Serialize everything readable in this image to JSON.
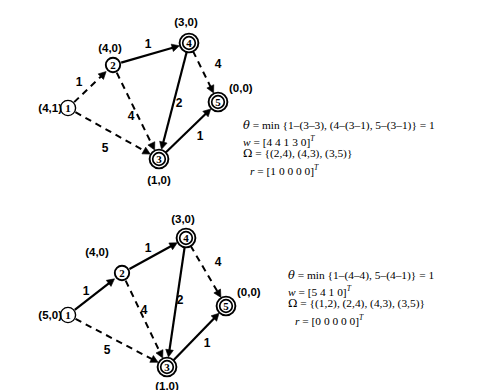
{
  "figure": {
    "type": "network-simplex-iterations",
    "background": "#ffffff",
    "ink": "#000000"
  },
  "panels": [
    {
      "id": "top",
      "nodes": [
        {
          "id": "1",
          "label": "1",
          "cx": 68,
          "cy": 108,
          "style": "thin",
          "pair": "(4,1)",
          "pair_x": 62,
          "pair_y": 108,
          "pair_anchor": "end"
        },
        {
          "id": "2",
          "label": "2",
          "cx": 113,
          "cy": 65,
          "style": "single",
          "pair": "(4,0)",
          "pair_x": 110,
          "pair_y": 48,
          "pair_anchor": "middle"
        },
        {
          "id": "3",
          "label": "3",
          "cx": 159,
          "cy": 159,
          "style": "double",
          "pair": "(1,0)",
          "pair_x": 159,
          "pair_y": 180,
          "pair_anchor": "middle"
        },
        {
          "id": "4",
          "label": "4",
          "cx": 189,
          "cy": 43,
          "style": "double",
          "pair": "(3,0)",
          "pair_x": 186,
          "pair_y": 22,
          "pair_anchor": "middle"
        },
        {
          "id": "5",
          "label": "5",
          "cx": 218,
          "cy": 102,
          "style": "double",
          "pair": "(0,0)",
          "pair_x": 229,
          "pair_y": 88,
          "pair_anchor": "start"
        }
      ],
      "edges": [
        {
          "from": "1",
          "to": "2",
          "weight": "1",
          "dashed": true,
          "wx": 79,
          "wy": 82,
          "curve": 0
        },
        {
          "from": "2",
          "to": "4",
          "weight": "1",
          "dashed": false,
          "wx": 148,
          "wy": 44,
          "curve": 0
        },
        {
          "from": "2",
          "to": "3",
          "weight": "4",
          "dashed": true,
          "wx": 131,
          "wy": 116,
          "curve": 0
        },
        {
          "from": "1",
          "to": "3",
          "weight": "5",
          "dashed": true,
          "wx": 105,
          "wy": 148,
          "curve": 0
        },
        {
          "from": "4",
          "to": "3",
          "weight": "2",
          "dashed": false,
          "wx": 179,
          "wy": 103,
          "curve": 0
        },
        {
          "from": "4",
          "to": "5",
          "weight": "4",
          "dashed": true,
          "wx": 218,
          "wy": 64,
          "curve": 0
        },
        {
          "from": "3",
          "to": "5",
          "weight": "1",
          "dashed": false,
          "wx": 200,
          "wy": 136,
          "curve": 0
        }
      ],
      "equations": {
        "x": 243,
        "y": 118,
        "lines": [
          {
            "lhs": "θ",
            "rhs": "= min {1–(3–3), (4–(3–1), 5–(3–1)} = 1",
            "italic_lhs": true,
            "indent": false
          },
          {
            "lhs": "w",
            "rhs": "= [4  4  1  3  0]",
            "sup": "T",
            "italic_lhs": true,
            "indent": false
          },
          {
            "lhs": "Ω",
            "rhs": "= {(2,4), (4,3), (3,5)}",
            "italic_lhs": false,
            "indent": false
          },
          {
            "lhs": "r",
            "rhs": "= [1  0  0  0  0]",
            "sup": "T",
            "italic_lhs": true,
            "indent": true
          }
        ]
      }
    },
    {
      "id": "bottom",
      "nodes": [
        {
          "id": "1",
          "label": "1",
          "cx": 68,
          "cy": 315,
          "style": "thin",
          "pair": "(5,0)",
          "pair_x": 62,
          "pair_y": 315,
          "pair_anchor": "end"
        },
        {
          "id": "2",
          "label": "2",
          "cx": 122,
          "cy": 273,
          "style": "single",
          "pair": "(4,0)",
          "pair_x": 97,
          "pair_y": 252,
          "pair_anchor": "middle"
        },
        {
          "id": "3",
          "label": "3",
          "cx": 167,
          "cy": 367,
          "style": "double",
          "pair": "(1,0)",
          "pair_x": 167,
          "pair_y": 386,
          "pair_anchor": "middle"
        },
        {
          "id": "4",
          "label": "4",
          "cx": 186,
          "cy": 238,
          "style": "double",
          "pair": "(3,0)",
          "pair_x": 183,
          "pair_y": 219,
          "pair_anchor": "middle"
        },
        {
          "id": "5",
          "label": "5",
          "cx": 226,
          "cy": 306,
          "style": "double",
          "pair": "(0,0)",
          "pair_x": 237,
          "pair_y": 292,
          "pair_anchor": "start"
        }
      ],
      "edges": [
        {
          "from": "1",
          "to": "2",
          "weight": "1",
          "dashed": false,
          "wx": 86,
          "wy": 291,
          "curve": 0
        },
        {
          "from": "2",
          "to": "4",
          "weight": "1",
          "dashed": false,
          "wx": 148,
          "wy": 248,
          "curve": 0
        },
        {
          "from": "2",
          "to": "3",
          "weight": "4",
          "dashed": true,
          "wx": 144,
          "wy": 310,
          "curve": 0
        },
        {
          "from": "1",
          "to": "3",
          "weight": "5",
          "dashed": true,
          "wx": 107,
          "wy": 350,
          "curve": 0
        },
        {
          "from": "4",
          "to": "3",
          "weight": "2",
          "dashed": false,
          "wx": 180,
          "wy": 300,
          "curve": 0
        },
        {
          "from": "4",
          "to": "5",
          "weight": "4",
          "dashed": true,
          "wx": 218,
          "wy": 262,
          "curve": 0
        },
        {
          "from": "3",
          "to": "5",
          "weight": "1",
          "dashed": false,
          "wx": 207,
          "wy": 343,
          "curve": 0
        }
      ],
      "equations": {
        "x": 288,
        "y": 268,
        "lines": [
          {
            "lhs": "θ",
            "rhs": "= min {1–(4–4), 5–(4–1)} = 1",
            "italic_lhs": true,
            "indent": false
          },
          {
            "lhs": "w",
            "rhs": "= [5  4  1  0]",
            "sup": "T",
            "italic_lhs": true,
            "indent": false
          },
          {
            "lhs": "Ω",
            "rhs": "= {(1,2), (2,4), (4,3), (3,5)}",
            "italic_lhs": false,
            "indent": false
          },
          {
            "lhs": "r",
            "rhs": "= [0  0  0  0  0]",
            "sup": "T",
            "italic_lhs": true,
            "indent": true
          }
        ]
      }
    }
  ]
}
